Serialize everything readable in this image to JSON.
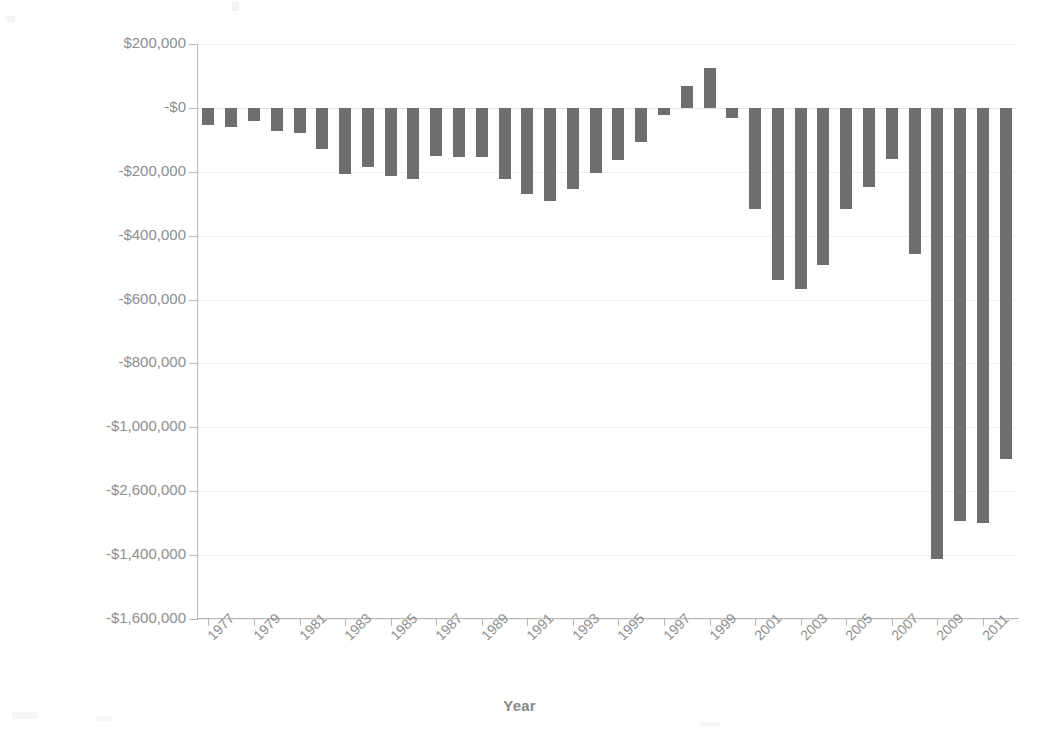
{
  "chart_data": {
    "type": "bar",
    "title": "",
    "xlabel": "Year",
    "ylabel": "Millions of Dollars",
    "grid": true,
    "legend": false,
    "bar_color": "#6e6e6e",
    "axis_color": "#b9b9b9",
    "label_color": "#8e8e8e",
    "ylim": [
      -1600000,
      200000
    ],
    "y_tick_values": [
      200000,
      0,
      -200000,
      -400000,
      -600000,
      -800000,
      -1000000,
      -1200000,
      -1400000,
      -1600000
    ],
    "y_tick_labels": [
      "$200,000",
      "-$0",
      "-$200,000",
      "-$400,000",
      "-$600,000",
      "-$800,000",
      "-$1,000,000",
      "-$2,600,000",
      "-$1,400,000",
      "-$1,600,000"
    ],
    "x_tick_labels": [
      "1977",
      "1979",
      "1981",
      "1983",
      "1985",
      "1987",
      "1989",
      "1991",
      "1993",
      "1995",
      "1997",
      "1999",
      "2001",
      "2003",
      "2005",
      "2007",
      "2009",
      "2011"
    ],
    "categories": [
      "1977",
      "1978",
      "1979",
      "1980",
      "1981",
      "1982",
      "1983",
      "1984",
      "1985",
      "1986",
      "1987",
      "1988",
      "1989",
      "1990",
      "1991",
      "1992",
      "1993",
      "1994",
      "1995",
      "1996",
      "1997",
      "1998",
      "1999",
      "2000",
      "2001",
      "2002",
      "2003",
      "2004",
      "2005",
      "2006",
      "2007",
      "2008",
      "2009",
      "2010",
      "2011",
      "2012"
    ],
    "values": [
      -53659,
      -59186,
      -40729,
      -73835,
      -78976,
      -127989,
      -207802,
      -185367,
      -212334,
      -221245,
      -149730,
      -155187,
      -152639,
      -221194,
      -269356,
      -290338,
      -255051,
      -203186,
      -163952,
      -107431,
      -21884,
      69270,
      125610,
      -32445,
      -317417,
      -538418,
      -568000,
      -493000,
      -318000,
      -248000,
      -160700,
      -458553,
      -1412688,
      -1294373,
      -1299593,
      -1100000
    ],
    "notes": {
      "positive_bars": [
        "1999",
        "2000"
      ],
      "deepest_bar_year": "2009",
      "y_label_anomaly": "The 8th y-axis tick is printed as -$2,600,000 although its position corresponds to -$1,200,000."
    }
  },
  "axis_titles": {
    "x": "Year",
    "y": "Millions of Dollars"
  }
}
